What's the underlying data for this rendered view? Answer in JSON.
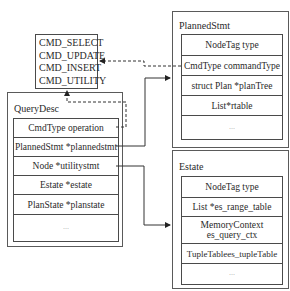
{
  "cmd_enum": {
    "values": [
      "CMD_SELECT",
      "CMD_UPDATE",
      "CMD_INSERT",
      "CMD_UTILITY"
    ]
  },
  "query_desc": {
    "title": "QueryDesc",
    "fields": [
      "CmdType operation",
      "PlannedStmt *plannedstmt",
      "Node *utilitystmt",
      "Estate *estate",
      "PlanState *planstate",
      "..."
    ]
  },
  "planned_stmt": {
    "title": "PlannedStmt",
    "fields": [
      "NodeTag type",
      "CmdType commandType",
      "struct Plan *planTree",
      "List*rtable",
      "..."
    ]
  },
  "estate": {
    "title": "Estate",
    "fields": [
      "NodeTag type",
      "List *es_range_table",
      "MemoryContext\nes_query_ctx",
      "TupleTablees_tupleTable",
      "..."
    ]
  },
  "connections": [
    {
      "from": "query_desc.operation",
      "to": "cmd_enum",
      "style": "dashed"
    },
    {
      "from": "planned_stmt.commandType",
      "to": "cmd_enum",
      "style": "dashed"
    },
    {
      "from": "query_desc.plannedstmt",
      "to": "planned_stmt",
      "style": "solid"
    },
    {
      "from": "query_desc.utilitystmt",
      "to": "estate",
      "style": "solid"
    }
  ]
}
